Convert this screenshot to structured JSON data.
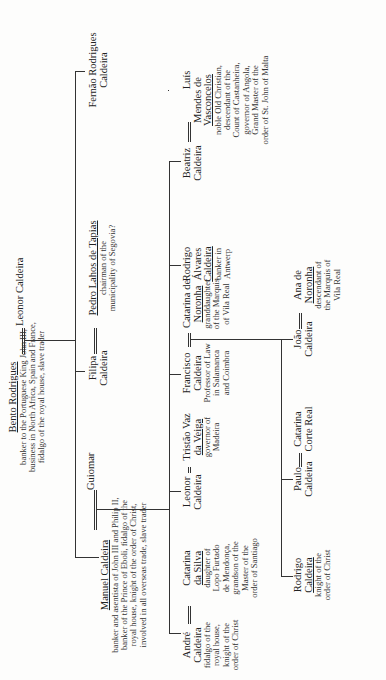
{
  "figure": {
    "type": "family-tree",
    "orientation": "rotated-90-ccw",
    "caption_fragment": "The Caldeira family (caption clipped at page edge)"
  },
  "generation1": {
    "husband": {
      "name": "Bento Rodrigues",
      "desc": [
        "banker to the Portuguese King John III,",
        "business in North Africa, Spain and France,",
        "fidalgo of the royal house, slave trader"
      ]
    },
    "wife": {
      "name": "Leonor Caldeira"
    }
  },
  "generation2": {
    "manuel": {
      "name": "Manuel Caldeira",
      "desc": [
        "banker and asentista of John III and Philip II,",
        "banker of the Prince of Eboli, fidalgo of the",
        "royal house, knight of the order of Christ,",
        "involved in all overseas trade, slave trader"
      ]
    },
    "guiomar": {
      "name": "Guiomar"
    },
    "filipa": {
      "name": "Filipa",
      "name2": "Caldeira"
    },
    "pedro": {
      "name": "Pedro Lahos de Tapias",
      "desc": [
        "chairman of the",
        "municipality of Segovia?"
      ]
    },
    "fernao": {
      "name": "Fernão Rodrigues",
      "name2": "Caldeira"
    }
  },
  "generation3": {
    "andre": {
      "name": "André",
      "name2": "Caldeira",
      "desc": [
        "fidalgo of the",
        "royal house,",
        "knight of the",
        "order of Christ"
      ]
    },
    "catarina_silva": {
      "name": "Catarina",
      "name2": "da Silva",
      "desc": [
        "daughter of",
        "Lopo Furtado",
        "de Mendonça,",
        "grandson of the",
        "Master of the",
        "order of Santiago"
      ]
    },
    "leonor": {
      "name": "Leonor",
      "name2": "Caldeira"
    },
    "tristao": {
      "name": "Tristão Vaz",
      "name2": "da Veiga",
      "desc": [
        "governor of",
        "Madeira"
      ]
    },
    "francisco": {
      "name": "Francisco",
      "name2": "Caldeira",
      "desc": [
        "Professor of Law",
        "in Salamanca",
        "and Coimbra"
      ]
    },
    "catarina_noronha": {
      "name": "Catarina de",
      "name2": "Noronha",
      "desc": [
        "granddaughter",
        "of the Marquis",
        "of Vila Real"
      ]
    },
    "rodrigo_alvares": {
      "name": "Rodrigo",
      "name2": "Álvares",
      "name3": "Caldeira",
      "desc": [
        "banker in",
        "Antwerp"
      ]
    },
    "beatriz": {
      "name": "Beatriz",
      "name2": "Caldeira"
    },
    "luis": {
      "name": "Luís",
      "name2": "Mendes de",
      "name3": "Vasconcelos",
      "desc": [
        "noble Old Christian,",
        "descendant of the",
        "Count of Castanheira,",
        "governor of Angola,",
        "Grand Master of the",
        "order of St. John of Malta"
      ]
    }
  },
  "generation4_francisco": {
    "rodrigo": {
      "name": "Rodrigo",
      "name2": "Caldeira",
      "desc": [
        "knight of the",
        "order of Christ"
      ]
    },
    "paulo": {
      "name": "Paulo",
      "name2": "Caldeira"
    },
    "catarina_corte_real": {
      "name": "Catarina",
      "name2": "Corte Real"
    },
    "joao": {
      "name": "João",
      "name2": "Caldeira"
    },
    "ana": {
      "name": "Ana de",
      "name2": "Noronha",
      "desc": [
        "descendant of",
        "the Marquis of",
        "Vila Real"
      ]
    }
  },
  "generation4_beatriz": [
    {
      "lines": [
        "Paula"
      ]
    },
    {
      "lines": [
        "Duarte"
      ]
    },
    {
      "lines": [
        "Maria"
      ]
    },
    {
      "lines": [
        "João"
      ]
    },
    {
      "lines": [
        "Bento",
        "Rodrigues"
      ],
      "desc": [
        "in India,",
        "married",
        "without",
        "permission"
      ]
    },
    {
      "lines": [
        "Diogo",
        "Rodrigues",
        "Caldeira"
      ]
    },
    {
      "lines": [
        "António",
        "Caldeira"
      ],
      "desc": [
        "in Madrid"
      ]
    }
  ]
}
